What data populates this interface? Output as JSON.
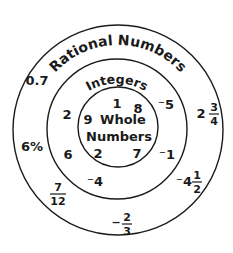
{
  "diagram": {
    "type": "nested-sets",
    "sets": [
      {
        "id": "rational",
        "label": "Rational Numbers"
      },
      {
        "id": "integers",
        "label": "Integers"
      },
      {
        "id": "whole",
        "label_line1": "Whole",
        "label_line2": "Numbers"
      }
    ],
    "rational_only": {
      "n1": "0.7",
      "n2": "6%",
      "f1": {
        "num": "7",
        "den": "12"
      },
      "f2": {
        "sign": "−",
        "num": "2",
        "den": "3"
      },
      "m1": {
        "whole": "⁻4",
        "num": "1",
        "den": "2"
      },
      "m2": {
        "whole": "2",
        "num": "3",
        "den": "4"
      }
    },
    "integers_only": {
      "i1": "⁻5",
      "i2": "⁻1",
      "i3": "⁻4",
      "i4": "2",
      "i5": "6"
    },
    "whole_numbers": {
      "w1": "1",
      "w2": "8",
      "w3": "9",
      "w4": "2",
      "w5": "7"
    },
    "colors": {
      "stroke": "#1a1a1a",
      "background": "#ffffff"
    }
  }
}
